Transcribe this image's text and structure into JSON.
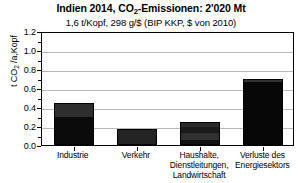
{
  "chart_data": {
    "type": "bar",
    "title_main": "Indien 2014, CO",
    "title_sub": "2",
    "title_rest": "-Emissionen: 2'020 Mt",
    "title": "Indien 2014, CO2-Emissionen: 2'020 Mt",
    "subtitle": "1,6 t/Kopf, 298 g/$ (BIP KKP, $ von 2010)",
    "ylabel_pre": "t CO",
    "ylabel_sub": "2",
    "ylabel_post": " /a,Kopf",
    "ylabel": "t CO2 /a,Kopf",
    "xlabel": "",
    "ylim": [
      0,
      1.2
    ],
    "ytick_values": [
      0.0,
      0.2,
      0.4,
      0.6,
      0.8,
      1.0,
      1.2
    ],
    "ytick_labels": [
      "0.0",
      "0.2",
      "0.4",
      "0.6",
      "0.8",
      "1.0",
      "1.2"
    ],
    "grid": true,
    "legend": "none",
    "categories": [
      "Industrie",
      "Verkehr",
      "Haushalte, Dienstleitungen, Landwirtschaft",
      "Verluste des Energiesektors"
    ],
    "category_lines": [
      [
        "Industrie"
      ],
      [
        "Verkehr"
      ],
      [
        "Haushalte,",
        "Dienstleitungen,",
        "Landwirtschaft"
      ],
      [
        "Verluste des",
        "Energiesektors"
      ]
    ],
    "values": [
      0.44,
      0.17,
      0.24,
      0.69
    ],
    "bars": [
      {
        "category": "Industrie",
        "total": 0.44,
        "segments": [
          {
            "from": 0.0,
            "to": 0.3,
            "color": "#0a0a0a"
          },
          {
            "from": 0.3,
            "to": 0.44,
            "color": "#2e2e2e"
          }
        ]
      },
      {
        "category": "Verkehr",
        "total": 0.17,
        "segments": [
          {
            "from": 0.0,
            "to": 0.17,
            "color": "#242424"
          }
        ]
      },
      {
        "category": "Haushalte, Dienstleitungen, Landwirtschaft",
        "total": 0.24,
        "segments": [
          {
            "from": 0.0,
            "to": 0.05,
            "color": "#111111"
          },
          {
            "from": 0.05,
            "to": 0.13,
            "color": "#303030"
          },
          {
            "from": 0.13,
            "to": 0.19,
            "color": "#1a1a1a"
          },
          {
            "from": 0.19,
            "to": 0.24,
            "color": "#2a2a2a"
          }
        ]
      },
      {
        "category": "Verluste des Energiesektors",
        "total": 0.69,
        "segments": [
          {
            "from": 0.0,
            "to": 0.66,
            "color": "#070707"
          },
          {
            "from": 0.66,
            "to": 0.69,
            "color": "#333333"
          }
        ]
      }
    ],
    "colors": {
      "bar_dark": "#0a0a0a",
      "bar_mid": "#2e2e2e",
      "grid": "#b8b8b8",
      "axis": "#000000",
      "background": "#ffffff"
    }
  }
}
